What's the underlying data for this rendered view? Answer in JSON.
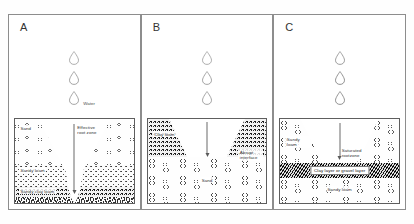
{
  "figure": {
    "caption": "",
    "panel_letters": [
      "A",
      "B",
      "C"
    ]
  },
  "icons": {
    "water_drop": "water-drop-icon",
    "down_arrow": "down-arrow-icon"
  },
  "panels": [
    {
      "letter": "A",
      "name": "uniform-deep-percolation",
      "water_label": "Water",
      "drop_count": 3,
      "labels": {
        "top_layer": "Sand",
        "mid_layer": "Sandy loam",
        "bottom_layer": "Sandy clay loam",
        "zone": "Effective root zone"
      }
    },
    {
      "letter": "B",
      "name": "clay-loam-over-sand-abrupt-interface",
      "water_label": "",
      "drop_count": 3,
      "labels": {
        "top_layer": "Clay loam",
        "bottom_layer": "Sand",
        "interface": "Abrupt interface"
      }
    },
    {
      "letter": "C",
      "name": "impeding-layer-saturated-rootzone",
      "water_label": "",
      "drop_count": 3,
      "labels": {
        "top_layer": "Sandy loam",
        "zone": "Saturated rootzone",
        "impeding_layer": "Clay layer or gravel layer",
        "bottom_layer": "Sandy loam"
      }
    }
  ],
  "colors": {
    "panel_border": "#8d8d8d",
    "soil_border": "#5e5e5e",
    "text": "#2f2f2f",
    "arrow": "#6a6a6a",
    "impeding_band": "#2a2a2a",
    "background": "#ffffff"
  }
}
